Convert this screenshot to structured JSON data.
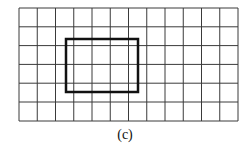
{
  "figure": {
    "caption": "(c)",
    "grid": {
      "columns": 12,
      "rows": 6,
      "x_lines": [
        19,
        37.25,
        55.5,
        73.75,
        92,
        110.25,
        128.5,
        146.75,
        165,
        183.25,
        201.5,
        219.75,
        238
      ],
      "y_lines": [
        8,
        26.8,
        45.6,
        64.4,
        83.2,
        102,
        121
      ],
      "line_color": "#3a3a3a",
      "line_width": 1
    },
    "highlight_rectangle": {
      "x": 66,
      "y": 39,
      "width": 72,
      "height": 53,
      "stroke_color": "#111111",
      "stroke_width": 2.5
    }
  }
}
